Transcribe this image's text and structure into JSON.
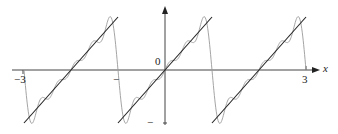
{
  "chart_data": {
    "type": "line",
    "title": "",
    "xlabel": "x",
    "ylabel": "",
    "xlim": [
      -3.3,
      3.3
    ],
    "ylim": [
      -1.05,
      1.2
    ],
    "grid": false,
    "legend": null,
    "x_ticks": [
      -3,
      -1,
      0,
      3
    ],
    "x_tick_labels": [
      "−3",
      "",
      "0",
      "3"
    ],
    "y_ticks": [
      -1
    ],
    "y_tick_labels": [
      "−"
    ],
    "origin_label": "0",
    "series": [
      {
        "name": "sawtooth f(x) = x (periodic, period 2)",
        "style": "black solid",
        "segments": [
          {
            "x": [
              -3,
              -1
            ],
            "y": [
              -1,
              1
            ]
          },
          {
            "x": [
              -1,
              1
            ],
            "y": [
              -1,
              1
            ]
          },
          {
            "x": [
              1,
              3
            ],
            "y": [
              -1,
              1
            ]
          }
        ]
      },
      {
        "name": "Fourier partial sum approximation",
        "style": "gray thin",
        "description": "Partial Fourier series of the sawtooth, oscillating around the lines with Gibbs overshoot near the jumps at x = -3, -1, 1, 3",
        "n_terms": 5,
        "x_range": [
          -3,
          3
        ]
      }
    ]
  },
  "labels": {
    "x_axis": "x",
    "tick_neg3": "−3",
    "tick_neg1": "−",
    "origin": "0",
    "tick_3": "3",
    "y_tick_neg1": "−"
  },
  "colors": {
    "axis": "#333333",
    "line": "#222222",
    "fourier": "#9a9a9a"
  }
}
